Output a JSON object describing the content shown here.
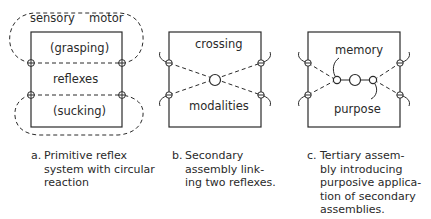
{
  "panels": [
    {
      "id": "a",
      "labels": {
        "sensory": "sensory",
        "motor": "motor",
        "top": "(grasping)",
        "middle": "reflexes",
        "bottom": "(sucking)"
      },
      "caption": {
        "letter": "a.",
        "lines": [
          "Primitive reflex",
          "system with circular",
          "reaction"
        ]
      }
    },
    {
      "id": "b",
      "labels": {
        "top": "crossing",
        "bottom": "modalities"
      },
      "caption": {
        "letter": "b.",
        "lines": [
          "Secondary",
          "assembly link-",
          "ing two reflexes."
        ]
      }
    },
    {
      "id": "c",
      "labels": {
        "top": "memory",
        "bottom": "purpose"
      },
      "caption": {
        "letter": "c.",
        "lines": [
          "Tertiary assem-",
          "bly introducing",
          "purposive applica-",
          "tion of secondary",
          "assemblies."
        ]
      }
    }
  ],
  "colors": {
    "ink": "#2a2a2a",
    "background": "#ffffff"
  }
}
